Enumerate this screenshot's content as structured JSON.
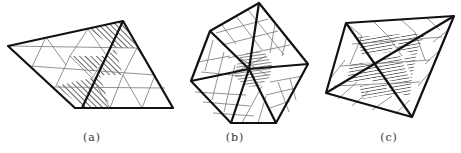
{
  "figure": {
    "panels": [
      {
        "id": "a",
        "caption": "(a)",
        "caption_x": 92,
        "shape": "rhombus-triangulated",
        "shading": "diagonal-hatch"
      },
      {
        "id": "b",
        "caption": "(b)",
        "caption_x": 235,
        "shape": "hexagon-triangulated",
        "shading": "horizontal-hatch-center"
      },
      {
        "id": "c",
        "caption": "(c)",
        "caption_x": 389,
        "shape": "quadrilateral-with-diagonals",
        "shading": "horizontal-hatch-inner"
      }
    ],
    "colors": {
      "line": "#111111",
      "grid": "#777777",
      "hatch": "#222222",
      "background": "#ffffff"
    }
  }
}
